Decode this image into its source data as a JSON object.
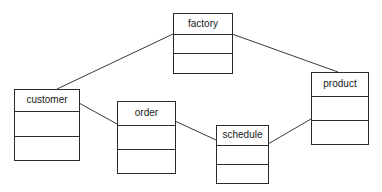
{
  "diagram": {
    "type": "uml-class-diagram",
    "classes": [
      {
        "id": "factory",
        "name": "factory",
        "x": 173,
        "y": 13,
        "w": 60,
        "h": 61,
        "name_h": 21,
        "attr_h": 19
      },
      {
        "id": "customer",
        "name": "customer",
        "x": 14,
        "y": 89,
        "w": 66,
        "h": 72,
        "name_h": 22,
        "attr_h": 25
      },
      {
        "id": "order",
        "name": "order",
        "x": 117,
        "y": 101,
        "w": 59,
        "h": 73,
        "name_h": 24,
        "attr_h": 24
      },
      {
        "id": "schedule",
        "name": "schedule",
        "x": 216,
        "y": 125,
        "w": 53,
        "h": 59,
        "name_h": 20,
        "attr_h": 19
      },
      {
        "id": "product",
        "name": "product",
        "x": 311,
        "y": 72,
        "w": 58,
        "h": 73,
        "name_h": 24,
        "attr_h": 24
      }
    ],
    "associations": [
      {
        "from": "factory",
        "to": "customer",
        "x1": 173,
        "y1": 34,
        "x2": 57,
        "y2": 89
      },
      {
        "from": "factory",
        "to": "product",
        "x1": 232,
        "y1": 34,
        "x2": 338,
        "y2": 72
      },
      {
        "from": "customer",
        "to": "order",
        "x1": 79,
        "y1": 103,
        "x2": 117,
        "y2": 124
      },
      {
        "from": "order",
        "to": "schedule",
        "x1": 175,
        "y1": 121,
        "x2": 216,
        "y2": 140
      },
      {
        "from": "schedule",
        "to": "product",
        "x1": 268,
        "y1": 144,
        "x2": 311,
        "y2": 119
      }
    ]
  }
}
